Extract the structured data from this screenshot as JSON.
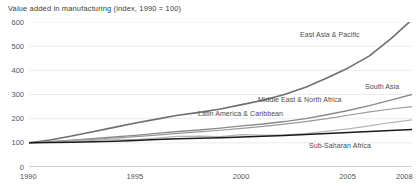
{
  "chart_data": {
    "type": "line",
    "title": "Value added in manufacturing (index, 1990 = 100)",
    "xlabel": "",
    "ylabel": "",
    "xlim": [
      1990,
      2008
    ],
    "ylim": [
      0,
      600
    ],
    "yticks": [
      "0",
      "100",
      "200",
      "300",
      "400",
      "500",
      "600"
    ],
    "ytick_values": [
      0,
      100,
      200,
      300,
      400,
      500,
      600
    ],
    "xticks": [
      "1990",
      "1995",
      "2000",
      "2005",
      "2008"
    ],
    "xtick_values": [
      1990,
      1995,
      2000,
      2005,
      2008
    ],
    "grid": true,
    "grid_axis": "y",
    "legend": "inline-labels",
    "x": [
      1990,
      1991,
      1992,
      1993,
      1994,
      1995,
      1996,
      1997,
      1998,
      1999,
      2000,
      2001,
      2002,
      2003,
      2004,
      2005,
      2006,
      2007,
      2008
    ],
    "series": [
      {
        "name": "East Asia & Pacific",
        "color": "#6e6e6e",
        "width": 1.6,
        "values": [
          100,
          112,
          128,
          146,
          164,
          182,
          198,
          214,
          226,
          240,
          258,
          276,
          300,
          330,
          368,
          410,
          460,
          530,
          610
        ],
        "label_x": 300,
        "label_y": 31
      },
      {
        "name": "South Asia",
        "color": "#8a8a8a",
        "width": 1.4,
        "values": [
          100,
          105,
          111,
          117,
          124,
          131,
          139,
          147,
          153,
          161,
          170,
          178,
          188,
          200,
          216,
          234,
          254,
          277,
          300
        ],
        "label_x": 365,
        "label_y": 83
      },
      {
        "name": "Middle East & North Africa",
        "color": "#9a9a9a",
        "width": 1.2,
        "values": [
          100,
          104,
          109,
          114,
          120,
          126,
          132,
          139,
          145,
          152,
          160,
          168,
          177,
          188,
          200,
          214,
          228,
          240,
          250
        ],
        "label_x": 258,
        "label_y": 96
      },
      {
        "name": "Latin America & Caribbean",
        "color": "#b4b4b4",
        "width": 1.2,
        "values": [
          100,
          103,
          107,
          110,
          116,
          113,
          120,
          127,
          128,
          126,
          134,
          132,
          133,
          138,
          148,
          158,
          170,
          184,
          195
        ],
        "label_x": 198,
        "label_y": 110
      },
      {
        "name": "Sub-Saharan Africa",
        "color": "#1a1a1a",
        "width": 1.5,
        "values": [
          100,
          101,
          102,
          104,
          107,
          110,
          114,
          117,
          119,
          121,
          124,
          127,
          130,
          134,
          139,
          143,
          147,
          151,
          155
        ],
        "label_x": 309,
        "label_y": 142
      }
    ]
  }
}
